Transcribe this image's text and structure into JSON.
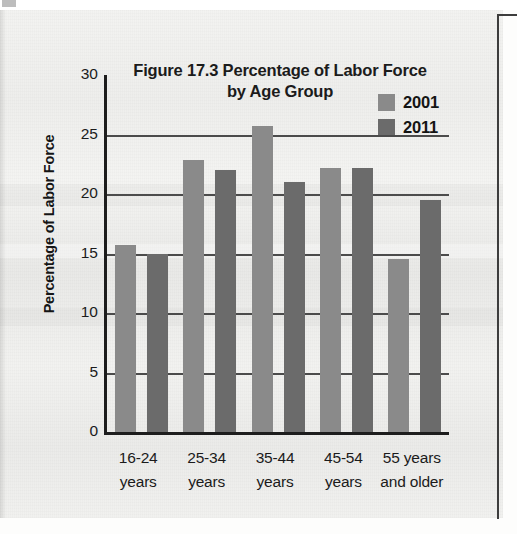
{
  "chart_data": {
    "type": "bar",
    "title": "Figure 17.3 Percentage of Labor Force by Age Group",
    "title_line1": "Figure 17.3 Percentage of Labor Force",
    "title_line2": "by Age Group",
    "xlabel": "",
    "ylabel": "Percentage of Labor Force",
    "ylim": [
      0,
      30
    ],
    "ytick_values": [
      30,
      25,
      20,
      15,
      10,
      5,
      0
    ],
    "ytick_labels": [
      "30",
      "25",
      "20",
      "15",
      "10",
      "5",
      "0"
    ],
    "grid": true,
    "grid_axis": "y",
    "legend_position": "top-right",
    "categories": [
      "16-24 years",
      "25-34 years",
      "35-44 years",
      "45-54 years",
      "55 years and older"
    ],
    "category_lines": [
      [
        "16-24",
        "years"
      ],
      [
        "25-34",
        "years"
      ],
      [
        "35-44",
        "years"
      ],
      [
        "45-54",
        "years"
      ],
      [
        "55 years",
        "and older"
      ]
    ],
    "series": [
      {
        "name": "2001",
        "color": "#8a8a8a",
        "values": [
          15.7,
          22.9,
          25.7,
          22.2,
          14.5
        ]
      },
      {
        "name": "2011",
        "color": "#6b6b6b",
        "values": [
          15.0,
          22.0,
          21.0,
          22.2,
          19.5
        ]
      }
    ]
  },
  "legend": {
    "items": [
      {
        "label": "2001",
        "color": "#8a8a8a"
      },
      {
        "label": "2011",
        "color": "#6b6b6b"
      }
    ]
  },
  "colors": {
    "axis": "#1d1d1d",
    "gridline": "#4b4b4b",
    "text": "#1b1b1b",
    "paper": "#f1f1ef",
    "series_2001": "#8a8a8a",
    "series_2011": "#6b6b6b"
  }
}
